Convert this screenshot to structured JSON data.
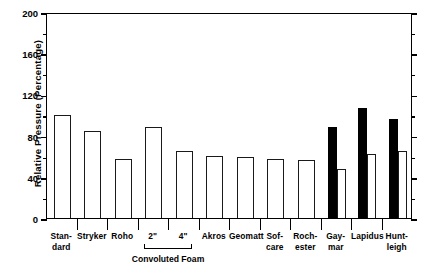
{
  "chart_data": {
    "type": "bar",
    "title": "",
    "xlabel": "",
    "ylabel": "Relative Pressure (Percentage)",
    "ylim": [
      0,
      200
    ],
    "ytick_labels": [
      "0",
      "40",
      "80",
      "120",
      "160",
      "200"
    ],
    "ytick_values": [
      0,
      40,
      80,
      120,
      160,
      200
    ],
    "yminor_values": [
      20,
      60,
      100,
      140,
      180
    ],
    "grid": false,
    "legend": "none",
    "categories": [
      "Stan-dard",
      "Stryker",
      "Roho",
      "2\"",
      "4\"",
      "Akros",
      "Geomatt",
      "Sof-care",
      "Roch-ester",
      "Gay-mar",
      "Lapidus",
      "Hunt-leigh"
    ],
    "category_labels": [
      {
        "line1": "Stan-",
        "line2": "dard"
      },
      {
        "line1": "Stryker",
        "line2": ""
      },
      {
        "line1": "Roho",
        "line2": ""
      },
      {
        "line1": "2\"",
        "line2": ""
      },
      {
        "line1": "4\"",
        "line2": ""
      },
      {
        "line1": "Akros",
        "line2": ""
      },
      {
        "line1": "Geomatt",
        "line2": ""
      },
      {
        "line1": "Sof-",
        "line2": "care"
      },
      {
        "line1": "Roch-",
        "line2": "ester"
      },
      {
        "line1": "Gay-",
        "line2": "mar"
      },
      {
        "line1": "Lapidus",
        "line2": ""
      },
      {
        "line1": "Hunt-",
        "line2": "leigh"
      }
    ],
    "group_bracket": {
      "label": "Convoluted Foam",
      "spans_categories": [
        "2\"",
        "4\""
      ]
    },
    "series": [
      {
        "name": "Filled (black)",
        "color": "#000000",
        "style": "filled",
        "values": [
          null,
          null,
          null,
          null,
          null,
          null,
          null,
          null,
          null,
          88,
          107,
          96
        ]
      },
      {
        "name": "Open (white)",
        "color": "#ffffff",
        "style": "open",
        "values": [
          100,
          84,
          57,
          88,
          65,
          60,
          59,
          57,
          56,
          48,
          62,
          65
        ]
      }
    ],
    "bars": [
      {
        "category": "Stan-dard",
        "value": 100,
        "style": "open"
      },
      {
        "category": "Stryker",
        "value": 84,
        "style": "open"
      },
      {
        "category": "Roho",
        "value": 57,
        "style": "open"
      },
      {
        "category": "2\"",
        "value": 88,
        "style": "open"
      },
      {
        "category": "4\"",
        "value": 65,
        "style": "open"
      },
      {
        "category": "Akros",
        "value": 60,
        "style": "open"
      },
      {
        "category": "Geomatt",
        "value": 59,
        "style": "open"
      },
      {
        "category": "Sof-care",
        "value": 57,
        "style": "open"
      },
      {
        "category": "Roch-ester",
        "value": 56,
        "style": "open"
      },
      {
        "category": "Gay-mar",
        "value": 88,
        "style": "filled"
      },
      {
        "category": "Gay-mar",
        "value": 48,
        "style": "open"
      },
      {
        "category": "Lapidus",
        "value": 107,
        "style": "filled"
      },
      {
        "category": "Lapidus",
        "value": 62,
        "style": "open"
      },
      {
        "category": "Hunt-leigh",
        "value": 96,
        "style": "filled"
      },
      {
        "category": "Hunt-leigh",
        "value": 65,
        "style": "open"
      }
    ]
  },
  "colors": {
    "axis": "#000000",
    "bar_filled": "#000000",
    "bar_open_fill": "#ffffff",
    "bar_open_stroke": "#1a1a1a",
    "background": "#ffffff"
  }
}
